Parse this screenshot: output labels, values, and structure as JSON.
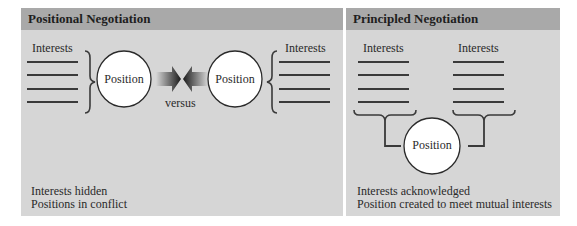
{
  "left_panel": {
    "title": "Positional Negotiation",
    "interests_label_left": "Interests",
    "interests_label_right": "Interests",
    "position_left": "Position",
    "position_right": "Position",
    "versus": "versus",
    "caption_line1": "Interests hidden",
    "caption_line2": "Positions in conflict"
  },
  "right_panel": {
    "title": "Principled Negotiation",
    "interests_label_left": "Interests",
    "interests_label_right": "Interests",
    "position": "Position",
    "caption_line1": "Interests acknowledged",
    "caption_line2": "Position created to meet mutual interests"
  },
  "colors": {
    "panel_bg": "#d6d6d6",
    "header_bg": "#a9a9a9",
    "line": "#3a3a3a",
    "circle_fill": "#ffffff"
  }
}
